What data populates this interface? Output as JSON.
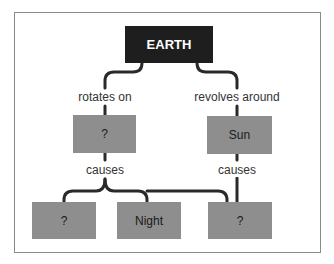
{
  "diagram": {
    "root": {
      "label": "EARTH",
      "color": "#1e1e1e"
    },
    "left_branch": {
      "edge_label": "rotates on",
      "node": {
        "label": "?"
      },
      "effect_label": "causes"
    },
    "right_branch": {
      "edge_label": "revolves around",
      "node": {
        "label": "Sun"
      },
      "effect_label": "causes"
    },
    "leaves": [
      {
        "label": "?"
      },
      {
        "label": "Night"
      },
      {
        "label": "?"
      }
    ],
    "colors": {
      "node_fill": "#8e8e8e",
      "root_fill": "#1e1e1e",
      "line": "#2a2a2a",
      "frame_border": "#8a8a8a"
    }
  }
}
